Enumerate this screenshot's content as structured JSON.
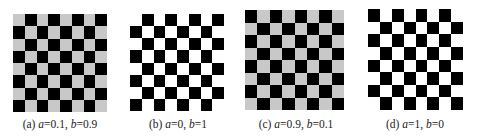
{
  "figure": {
    "panels": [
      {
        "id": "a",
        "label": "(a)",
        "a_value": "0.1",
        "b_value": "0.9",
        "caption_rest_a": "=0.1, ",
        "caption_rest_b": "=0.9",
        "light_color": "#c8c8c8",
        "dark_color": "#000000",
        "top_left_dark": false,
        "rows": 8,
        "cols": 8,
        "box": {
          "x": 13,
          "y": 14,
          "w": 94,
          "h": 98
        },
        "caption_x": 60
      },
      {
        "id": "b",
        "label": "(b)",
        "a_value": "0",
        "b_value": "1",
        "caption_rest_a": "=0, ",
        "caption_rest_b": "=1",
        "light_color": "#ffffff",
        "dark_color": "#000000",
        "top_left_dark": false,
        "rows": 8,
        "cols": 8,
        "box": {
          "x": 130,
          "y": 14,
          "w": 94,
          "h": 97
        },
        "caption_x": 178
      },
      {
        "id": "c",
        "label": "(c)",
        "a_value": "0.9",
        "b_value": "0.1",
        "caption_rest_a": "=0.9, ",
        "caption_rest_b": "=0.1",
        "light_color": "#c8c8c8",
        "dark_color": "#000000",
        "top_left_dark": true,
        "rows": 8,
        "cols": 8,
        "box": {
          "x": 245,
          "y": 10,
          "w": 99,
          "h": 100
        },
        "caption_x": 296
      },
      {
        "id": "d",
        "label": "(d)",
        "a_value": "1",
        "b_value": "0",
        "caption_rest_a": "=1, ",
        "caption_rest_b": "=0",
        "light_color": "#ffffff",
        "dark_color": "#000000",
        "top_left_dark": true,
        "rows": 8,
        "cols": 8,
        "box": {
          "x": 368,
          "y": 9,
          "w": 95,
          "h": 101
        },
        "caption_x": 415
      }
    ],
    "var_a": "a",
    "var_b": "b",
    "caption_y": 118
  }
}
